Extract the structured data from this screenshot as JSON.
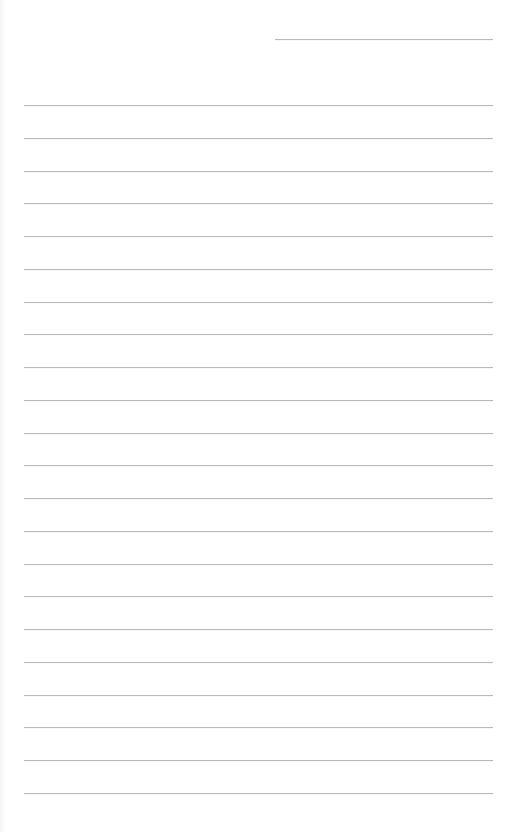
{
  "document": {
    "type": "lined-notebook-page",
    "background_color": "#ffffff",
    "line_color": "#b9b9b9",
    "header_line": {
      "x_start": 275,
      "x_end": 493,
      "y": 39
    },
    "rules": {
      "x_start": 24,
      "x_end": 493,
      "first_y": 105,
      "spacing": 32.76,
      "count": 22
    }
  }
}
